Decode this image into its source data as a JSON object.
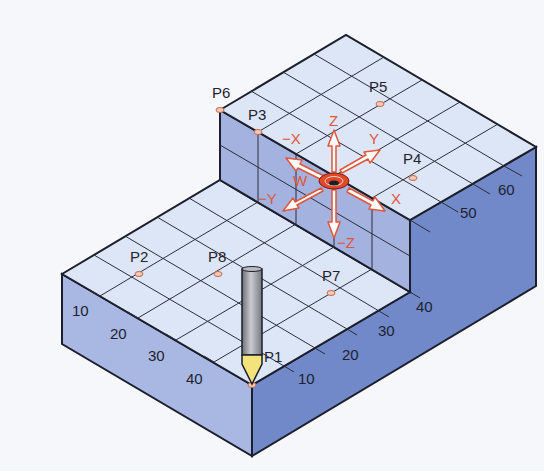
{
  "colors": {
    "background": "#f5f7fb",
    "top_face": "#dde6f6",
    "left_face": "#a9b8e2",
    "right_face": "#7189c9",
    "step_wall": "#a3b2de",
    "outline": "#1c1f2b",
    "axis_accent": "#e0563a",
    "point_marker": "#f6c8b6",
    "probe_tip": "#f4e27a",
    "probe_shaft": "#9a9ca4"
  },
  "points": [
    {
      "id": "P1",
      "label": "P1"
    },
    {
      "id": "P2",
      "label": "P2"
    },
    {
      "id": "P3",
      "label": "P3"
    },
    {
      "id": "P4",
      "label": "P4"
    },
    {
      "id": "P5",
      "label": "P5"
    },
    {
      "id": "P6",
      "label": "P6"
    },
    {
      "id": "P7",
      "label": "P7"
    },
    {
      "id": "P8",
      "label": "P8"
    }
  ],
  "axes": {
    "z": "Z",
    "neg_z": "−Z",
    "x": "X",
    "neg_x": "−X",
    "y": "Y",
    "neg_y": "−Y",
    "w": "W"
  },
  "scale_left": [
    "10",
    "20",
    "30",
    "40"
  ],
  "scale_right": [
    "10",
    "20",
    "30",
    "40",
    "50",
    "60"
  ]
}
